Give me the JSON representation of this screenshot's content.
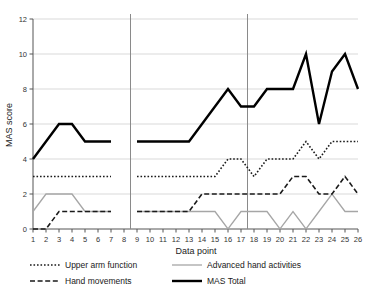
{
  "chart_data": {
    "type": "line",
    "title": "",
    "xlabel": "Data point",
    "ylabel": "MAS score",
    "xlim": [
      1,
      26
    ],
    "ylim": [
      0,
      12
    ],
    "yticks": [
      0,
      2,
      4,
      6,
      8,
      10,
      12
    ],
    "xticks": [
      1,
      2,
      3,
      4,
      5,
      6,
      7,
      8,
      9,
      10,
      11,
      12,
      13,
      14,
      15,
      16,
      17,
      18,
      19,
      20,
      21,
      22,
      23,
      24,
      25,
      26
    ],
    "grid": "horizontal",
    "legend_position": "bottom",
    "phase_separators": [
      8.5,
      17.5
    ],
    "data_gap_after": 8,
    "x": [
      1,
      2,
      3,
      4,
      5,
      6,
      7,
      8,
      9,
      10,
      11,
      12,
      13,
      14,
      15,
      16,
      17,
      18,
      19,
      20,
      21,
      22,
      23,
      24,
      25,
      26
    ],
    "series": [
      {
        "name": "Upper arm function",
        "style": "dotted",
        "color": "#1a1a1a",
        "values": [
          3,
          3,
          3,
          3,
          3,
          3,
          3,
          null,
          3,
          3,
          3,
          3,
          3,
          3,
          3,
          4,
          4,
          3,
          4,
          4,
          4,
          5,
          4,
          5,
          5,
          5
        ]
      },
      {
        "name": "Hand movements",
        "style": "dashed",
        "color": "#1a1a1a",
        "values": [
          0,
          0,
          1,
          1,
          1,
          1,
          1,
          null,
          1,
          1,
          1,
          1,
          1,
          2,
          2,
          2,
          2,
          2,
          2,
          2,
          3,
          3,
          2,
          2,
          3,
          2
        ]
      },
      {
        "name": "Advanced hand activities",
        "style": "solid-gray",
        "color": "#a6a6a6",
        "values": [
          1,
          2,
          2,
          2,
          1,
          1,
          1,
          null,
          1,
          1,
          1,
          1,
          1,
          1,
          1,
          0,
          1,
          1,
          1,
          0,
          1,
          0,
          1,
          2,
          1,
          1
        ]
      },
      {
        "name": "MAS Total",
        "style": "solid-thick",
        "color": "#000000",
        "values": [
          4,
          5,
          6,
          6,
          5,
          5,
          5,
          null,
          5,
          5,
          5,
          5,
          5,
          6,
          7,
          8,
          7,
          7,
          8,
          8,
          8,
          10,
          6,
          9,
          10,
          8
        ]
      }
    ]
  },
  "legend": {
    "entries": [
      {
        "label": "Upper arm function",
        "key": "upper-arm-function"
      },
      {
        "label": "Advanced hand activities",
        "key": "advanced-hand-activities"
      },
      {
        "label": "Hand movements",
        "key": "hand-movements"
      },
      {
        "label": "MAS Total",
        "key": "mas-total"
      }
    ]
  }
}
